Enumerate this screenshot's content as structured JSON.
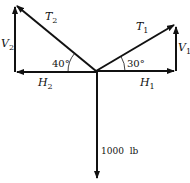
{
  "diagram": {
    "vectors": [
      {
        "id": "T2",
        "label_main": "T",
        "label_sub": "2"
      },
      {
        "id": "V2",
        "label_main": "V",
        "label_sub": "2"
      },
      {
        "id": "H2",
        "label_main": "H",
        "label_sub": "2"
      },
      {
        "id": "T1",
        "label_main": "T",
        "label_sub": "1"
      },
      {
        "id": "V1",
        "label_main": "V",
        "label_sub": "1"
      },
      {
        "id": "H1",
        "label_main": "H",
        "label_sub": "1"
      }
    ],
    "angles": {
      "left": "40°",
      "right": "30°"
    },
    "load": "1000  lb",
    "colors": {
      "stroke": "#111111",
      "background": "#ffffff"
    }
  }
}
